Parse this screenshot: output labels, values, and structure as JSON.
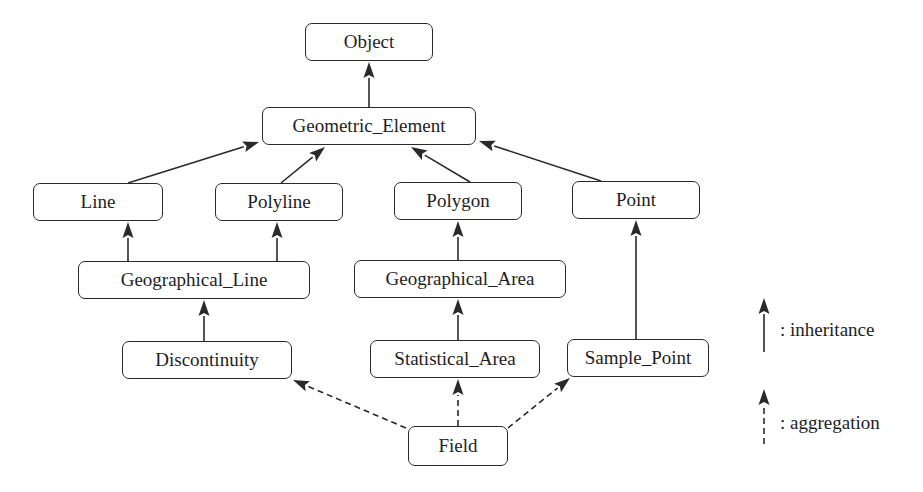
{
  "diagram": {
    "type": "class-hierarchy",
    "colors": {
      "line": "#2a2a2a",
      "text": "#1e1e1e",
      "background": "#ffffff"
    },
    "nodes": [
      {
        "id": "object",
        "label": "Object",
        "x": 305,
        "y": 23,
        "w": 128,
        "h": 38
      },
      {
        "id": "geometric_element",
        "label": "Geometric_Element",
        "x": 262,
        "y": 107,
        "w": 214,
        "h": 38
      },
      {
        "id": "line",
        "label": "Line",
        "x": 33,
        "y": 183,
        "w": 130,
        "h": 38
      },
      {
        "id": "polyline",
        "label": "Polyline",
        "x": 215,
        "y": 183,
        "w": 128,
        "h": 38
      },
      {
        "id": "polygon",
        "label": "Polygon",
        "x": 394,
        "y": 182,
        "w": 128,
        "h": 38
      },
      {
        "id": "point",
        "label": "Point",
        "x": 572,
        "y": 181,
        "w": 128,
        "h": 38
      },
      {
        "id": "geographical_line",
        "label": "Geographical_Line",
        "x": 78,
        "y": 261,
        "w": 232,
        "h": 38
      },
      {
        "id": "geographical_area",
        "label": "Geographical_Area",
        "x": 354,
        "y": 260,
        "w": 212,
        "h": 38
      },
      {
        "id": "discontinuity",
        "label": "Discontinuity",
        "x": 122,
        "y": 341,
        "w": 170,
        "h": 38
      },
      {
        "id": "statistical_area",
        "label": "Statistical_Area",
        "x": 370,
        "y": 340,
        "w": 170,
        "h": 38
      },
      {
        "id": "sample_point",
        "label": "Sample_Point",
        "x": 567,
        "y": 339,
        "w": 142,
        "h": 38
      },
      {
        "id": "field",
        "label": "Field",
        "x": 408,
        "y": 426,
        "w": 100,
        "h": 40
      }
    ],
    "edges": [
      {
        "from": "geometric_element",
        "to": "object",
        "kind": "inheritance",
        "x1": 369,
        "y1": 107,
        "x2": 369,
        "y2": 62
      },
      {
        "from": "line",
        "to": "geometric_element",
        "kind": "inheritance",
        "x1": 128,
        "y1": 183,
        "x2": 259,
        "y2": 142
      },
      {
        "from": "polyline",
        "to": "geometric_element",
        "kind": "inheritance",
        "x1": 281,
        "y1": 183,
        "x2": 325,
        "y2": 147
      },
      {
        "from": "polygon",
        "to": "geometric_element",
        "kind": "inheritance",
        "x1": 470,
        "y1": 182,
        "x2": 411,
        "y2": 147
      },
      {
        "from": "point",
        "to": "geometric_element",
        "kind": "inheritance",
        "x1": 601,
        "y1": 181,
        "x2": 479,
        "y2": 141
      },
      {
        "from": "geographical_line",
        "to": "line",
        "kind": "inheritance",
        "x1": 128,
        "y1": 261,
        "x2": 128,
        "y2": 222
      },
      {
        "from": "geographical_line",
        "to": "polyline",
        "kind": "inheritance",
        "x1": 277,
        "y1": 261,
        "x2": 277,
        "y2": 222
      },
      {
        "from": "geographical_area",
        "to": "polygon",
        "kind": "inheritance",
        "x1": 458,
        "y1": 260,
        "x2": 458,
        "y2": 221
      },
      {
        "from": "point_link",
        "to": "point",
        "kind": "inheritance",
        "x1": 636,
        "y1": 339,
        "x2": 636,
        "y2": 220
      },
      {
        "from": "discontinuity",
        "to": "geographical_line",
        "kind": "inheritance",
        "x1": 204,
        "y1": 341,
        "x2": 204,
        "y2": 300
      },
      {
        "from": "statistical_area",
        "to": "geographical_area",
        "kind": "inheritance",
        "x1": 458,
        "y1": 340,
        "x2": 458,
        "y2": 299
      },
      {
        "from": "field",
        "to": "discontinuity",
        "kind": "aggregation",
        "x1": 406,
        "y1": 428,
        "x2": 293,
        "y2": 380
      },
      {
        "from": "field",
        "to": "statistical_area",
        "kind": "aggregation",
        "x1": 458,
        "y1": 426,
        "x2": 458,
        "y2": 379
      },
      {
        "from": "field",
        "to": "sample_point",
        "kind": "aggregation",
        "x1": 508,
        "y1": 428,
        "x2": 570,
        "y2": 378
      }
    ]
  },
  "legend": {
    "items": [
      {
        "kind": "inheritance",
        "label": ": inheritance",
        "x1": 764,
        "y1": 352,
        "x2": 764,
        "y2": 298,
        "label_x": 780,
        "label_y": 330
      },
      {
        "kind": "aggregation",
        "label": ": aggregation",
        "x1": 764,
        "y1": 444,
        "x2": 764,
        "y2": 389,
        "label_x": 780,
        "label_y": 423
      }
    ]
  }
}
